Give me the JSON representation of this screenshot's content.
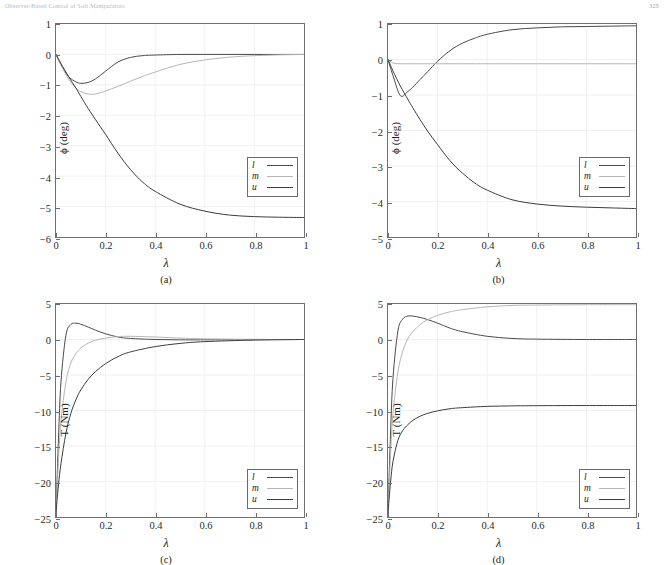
{
  "header": {
    "title": "Observer-Based Control of Soft Manipulators",
    "page_number": "325"
  },
  "figure": {
    "panels": [
      {
        "id": "a",
        "caption": "(a)",
        "xlabel": "λ",
        "ylabel": "ϕ (deg)",
        "legend": [
          "l",
          "m",
          "u"
        ]
      },
      {
        "id": "b",
        "caption": "(b)",
        "xlabel": "λ",
        "ylabel": "ϕ (deg)",
        "legend": [
          "l",
          "m",
          "u"
        ]
      },
      {
        "id": "c",
        "caption": "(c)",
        "xlabel": "λ",
        "ylabel": "T (Nm)",
        "legend": [
          "l",
          "m",
          "u"
        ]
      },
      {
        "id": "d",
        "caption": "(d)",
        "xlabel": "λ",
        "ylabel": "T (Nm)",
        "legend": [
          "l",
          "m",
          "u"
        ]
      }
    ]
  },
  "colors": {
    "series_l": "#4a4a4a",
    "series_m": "#b5b5b5",
    "series_u": "#3c3c3c",
    "axis": "#6f6f73",
    "grid": "#f0f0f2"
  },
  "chart_data": [
    {
      "type": "line",
      "panel": "a",
      "title": "",
      "xlabel": "λ",
      "ylabel": "ϕ (deg)",
      "xlim": [
        0,
        1
      ],
      "ylim": [
        -6,
        1
      ],
      "xticks": [
        0,
        0.2,
        0.4,
        0.6,
        0.8,
        1
      ],
      "yticks": [
        1,
        0,
        -1,
        -2,
        -3,
        -4,
        -5,
        -6
      ],
      "grid": true,
      "legend": [
        "l",
        "m",
        "u"
      ],
      "legend_position": "lower-right",
      "x": [
        0,
        0.02,
        0.05,
        0.08,
        0.1,
        0.13,
        0.16,
        0.2,
        0.25,
        0.3,
        0.35,
        0.4,
        0.5,
        0.6,
        0.7,
        0.8,
        0.9,
        1.0
      ],
      "series": [
        {
          "name": "l",
          "values": [
            0,
            -0.33,
            -0.72,
            -0.9,
            -0.95,
            -0.92,
            -0.8,
            -0.55,
            -0.25,
            -0.1,
            -0.04,
            -0.02,
            0.0,
            0.0,
            0.0,
            0.0,
            0.0,
            0.0
          ]
        },
        {
          "name": "m",
          "values": [
            0,
            -0.35,
            -0.8,
            -1.1,
            -1.22,
            -1.3,
            -1.3,
            -1.2,
            -1.05,
            -0.88,
            -0.72,
            -0.58,
            -0.33,
            -0.18,
            -0.09,
            -0.04,
            -0.015,
            0.0
          ]
        },
        {
          "name": "u",
          "values": [
            0,
            -0.3,
            -0.72,
            -1.1,
            -1.38,
            -1.78,
            -2.15,
            -2.63,
            -3.25,
            -3.78,
            -4.2,
            -4.5,
            -4.92,
            -5.15,
            -5.28,
            -5.33,
            -5.35,
            -5.36
          ]
        }
      ]
    },
    {
      "type": "line",
      "panel": "b",
      "title": "",
      "xlabel": "λ",
      "ylabel": "ϕ (deg)",
      "xlim": [
        0,
        1
      ],
      "ylim": [
        -5,
        1
      ],
      "xticks": [
        0,
        0.2,
        0.4,
        0.6,
        0.8,
        1
      ],
      "yticks": [
        1,
        0,
        -1,
        -2,
        -3,
        -4,
        -5
      ],
      "grid": true,
      "legend": [
        "l",
        "m",
        "u"
      ],
      "legend_position": "lower-right",
      "x": [
        0,
        0.02,
        0.05,
        0.08,
        0.1,
        0.13,
        0.16,
        0.2,
        0.25,
        0.3,
        0.35,
        0.4,
        0.5,
        0.6,
        0.7,
        0.8,
        0.9,
        1.0
      ],
      "series": [
        {
          "name": "l",
          "values": [
            0,
            -0.45,
            -1.02,
            -0.9,
            -0.78,
            -0.56,
            -0.34,
            -0.05,
            0.25,
            0.46,
            0.6,
            0.71,
            0.84,
            0.89,
            0.92,
            0.93,
            0.94,
            0.95
          ]
        },
        {
          "name": "m",
          "values": [
            0,
            -0.1,
            -0.12,
            -0.12,
            -0.12,
            -0.12,
            -0.12,
            -0.12,
            -0.12,
            -0.12,
            -0.12,
            -0.12,
            -0.12,
            -0.12,
            -0.12,
            -0.12,
            -0.12,
            -0.12
          ]
        },
        {
          "name": "u",
          "values": [
            0,
            -0.32,
            -0.75,
            -1.12,
            -1.36,
            -1.7,
            -2.02,
            -2.4,
            -2.85,
            -3.2,
            -3.48,
            -3.68,
            -3.95,
            -4.07,
            -4.13,
            -4.16,
            -4.18,
            -4.2
          ]
        }
      ]
    },
    {
      "type": "line",
      "panel": "c",
      "title": "",
      "xlabel": "λ",
      "ylabel": "T (Nm)",
      "xlim": [
        0,
        1
      ],
      "ylim": [
        -25,
        5
      ],
      "xticks": [
        0,
        0.2,
        0.4,
        0.6,
        0.8,
        1
      ],
      "yticks": [
        5,
        0,
        -5,
        -10,
        -15,
        -20,
        -25
      ],
      "grid": true,
      "legend": [
        "l",
        "m",
        "u"
      ],
      "legend_position": "lower-right",
      "x": [
        0,
        0.01,
        0.02,
        0.04,
        0.06,
        0.08,
        0.1,
        0.13,
        0.16,
        0.2,
        0.25,
        0.3,
        0.4,
        0.5,
        0.6,
        0.8,
        1.0
      ],
      "series": [
        {
          "name": "l",
          "values": [
            -24.4,
            -14.0,
            -6.0,
            0.6,
            2.1,
            2.3,
            2.15,
            1.75,
            1.3,
            0.8,
            0.35,
            0.15,
            0.0,
            -0.05,
            -0.05,
            -0.02,
            0.0
          ]
        },
        {
          "name": "m",
          "values": [
            -24.4,
            -17.0,
            -11.5,
            -6.0,
            -3.3,
            -2.0,
            -1.2,
            -0.5,
            -0.1,
            0.2,
            0.4,
            0.45,
            0.35,
            0.2,
            0.1,
            0.02,
            0.0
          ]
        },
        {
          "name": "u",
          "values": [
            -24.4,
            -20.5,
            -17.5,
            -13.2,
            -10.4,
            -8.5,
            -7.1,
            -5.6,
            -4.5,
            -3.4,
            -2.4,
            -1.75,
            -1.0,
            -0.55,
            -0.3,
            -0.08,
            0.0
          ]
        }
      ]
    },
    {
      "type": "line",
      "panel": "d",
      "title": "",
      "xlabel": "λ",
      "ylabel": "T (Nm)",
      "xlim": [
        0,
        1
      ],
      "ylim": [
        -25,
        5
      ],
      "xticks": [
        0,
        0.2,
        0.4,
        0.6,
        0.8,
        1
      ],
      "yticks": [
        5,
        0,
        -5,
        -10,
        -15,
        -20,
        -25
      ],
      "grid": true,
      "legend": [
        "l",
        "m",
        "u"
      ],
      "legend_position": "lower-right",
      "x": [
        0,
        0.01,
        0.02,
        0.04,
        0.06,
        0.08,
        0.1,
        0.13,
        0.16,
        0.2,
        0.25,
        0.3,
        0.4,
        0.5,
        0.6,
        0.8,
        1.0
      ],
      "series": [
        {
          "name": "l",
          "values": [
            -24.4,
            -13.5,
            -5.5,
            1.2,
            2.9,
            3.3,
            3.3,
            3.1,
            2.8,
            2.3,
            1.6,
            1.1,
            0.45,
            0.15,
            0.05,
            0.0,
            0.0
          ]
        },
        {
          "name": "m",
          "values": [
            -24.4,
            -16.5,
            -10.5,
            -4.6,
            -1.6,
            0.1,
            1.1,
            2.1,
            2.8,
            3.4,
            3.9,
            4.2,
            4.6,
            4.8,
            4.85,
            4.9,
            4.9
          ]
        },
        {
          "name": "u",
          "values": [
            -24.4,
            -20.2,
            -17.2,
            -14.2,
            -12.8,
            -12.0,
            -11.4,
            -10.8,
            -10.4,
            -10.05,
            -9.75,
            -9.6,
            -9.42,
            -9.35,
            -9.32,
            -9.3,
            -9.3
          ]
        }
      ]
    }
  ]
}
